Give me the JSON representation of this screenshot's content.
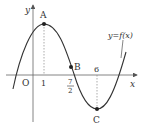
{
  "figure": {
    "type": "function-graph",
    "curve_label": "y=f(x)",
    "axes": {
      "x_label": "x",
      "y_label": "y",
      "origin_label": "O"
    },
    "tick_labels": {
      "one": "1",
      "seven_halves_num": "7",
      "seven_halves_den": "2",
      "six": "6"
    },
    "points": [
      {
        "label": "A",
        "x": "1",
        "role": "local maximum"
      },
      {
        "label": "B",
        "x": "7/2",
        "role": "point on curve"
      },
      {
        "label": "C",
        "x": "6",
        "role": "local minimum"
      }
    ],
    "colors": {
      "curve": "#333333",
      "axis": "#555555",
      "dashed": "#888888"
    }
  }
}
